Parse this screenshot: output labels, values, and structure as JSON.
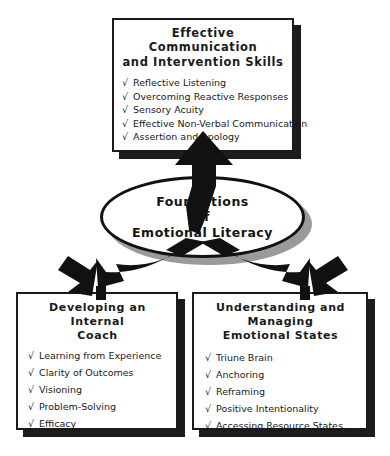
{
  "diagram": {
    "title": "Foundations of Emotional Literacy",
    "background_color": "#ffffff",
    "ink_color": "#1a1a1a",
    "shadow_color": "#1c1c1c",
    "hub_shadow_color": "#9a9a9a",
    "check_glyph": "√"
  },
  "hub": {
    "line1": "Foundations",
    "line2": "of",
    "line3": "Emotional Literacy"
  },
  "nodes": {
    "top": {
      "title_line1": "Effective Communication",
      "title_line2": "and Intervention Skills",
      "items": [
        "Reflective Listening",
        "Overcoming Reactive Responses",
        "Sensory Acuity",
        "Effective Non-Verbal Communication",
        "Assertion and Apology"
      ]
    },
    "left": {
      "title_line1": "Developing an Internal",
      "title_line2": "Coach",
      "items": [
        "Learning from Experience",
        "Clarity of Outcomes",
        "Visioning",
        "Problem-Solving",
        "Efficacy"
      ]
    },
    "right": {
      "title_line1": "Understanding and Managing",
      "title_line2": "Emotional States",
      "items": [
        "Triune Brain",
        "Anchoring",
        "Reframing",
        "Positive Intentionality",
        "Accessing Resource States"
      ]
    }
  },
  "connectors": [
    {
      "name": "arrow-hub-to-top",
      "direction": "up",
      "from": "hub",
      "to": "top"
    },
    {
      "name": "arrow-hub-to-left",
      "direction": "down-left",
      "from": "hub",
      "to": "left"
    },
    {
      "name": "arrow-hub-to-right",
      "direction": "down-right",
      "from": "hub",
      "to": "right"
    }
  ]
}
